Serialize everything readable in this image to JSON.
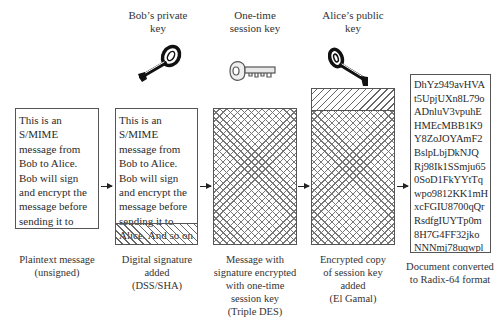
{
  "diagram": {
    "keys": [
      {
        "label": "Bob’s private\nkey",
        "icon": "dark-key-icon"
      },
      {
        "label": "One-time\nsession key",
        "icon": "light-key-icon"
      },
      {
        "label": "Alice’s public\nkey",
        "icon": "dark-key-icon"
      }
    ],
    "stages": [
      {
        "content": "This is an\nS/MIME\nmessage from\nBob to Alice.\nBob will sign\nand encrypt the\nmessage before\nsending it to\nAlice. And so on",
        "caption": "Plaintext message\n(unsigned)"
      },
      {
        "content": "This is an\nS/MIME\nmessage from\nBob to Alice.\nBob will sign\nand encrypt the\nmessage before\nsending it to\nAlice. And so on",
        "caption": "Digital signature\nadded\n(DSS/SHA)"
      },
      {
        "content": "",
        "caption": "Message with\nsignature encrypted\nwith one-time\nsession key\n(Triple DES)"
      },
      {
        "content": "",
        "caption": "Encrypted copy\nof session key\nadded\n(El Gamal)"
      },
      {
        "content": "DhYz949avHVA\nt5UpjUXn8L79o\nADnluV3vpuhE\nHMEcMBB1K9\nY8ZoJOYAmF2\nBslpLbjDkNJQ\nRj98Ik1SSmju65\n0SoD1FkYYtTq\nwpo9812KK1mH\nxcFGIU8700qQr\nRsdfgIUYTp0m\n8H7G4FF32jko\nNNNmj78uqwpl\nHYTG0098UhYt",
        "caption": "Document converted\nto Radix-64 format"
      }
    ]
  }
}
